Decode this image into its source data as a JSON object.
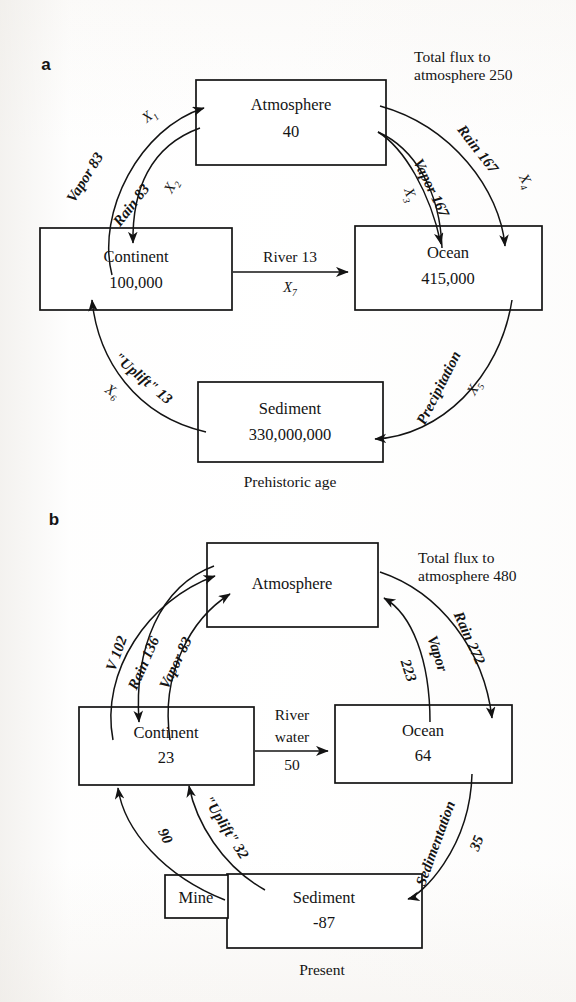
{
  "figure": {
    "title_present": false,
    "panels": [
      {
        "id": "a",
        "letter": "a",
        "caption": "Prehistoric age",
        "flux_header_line1": "Total flux to",
        "flux_header_line2": "atmosphere 250",
        "nodes": [
          {
            "name": "atmosphere",
            "label": "Atmosphere",
            "value": "40"
          },
          {
            "name": "continent",
            "label": "Continent",
            "value": "100,000"
          },
          {
            "name": "ocean",
            "label": "Ocean",
            "value": "415,000"
          },
          {
            "name": "sediment",
            "label": "Sediment",
            "value": "330,000,000"
          }
        ],
        "flows": [
          {
            "name": "continent-to-atmosphere-vapor",
            "label": "Vapor 83",
            "symbol": "X",
            "sub": "1"
          },
          {
            "name": "atmosphere-to-continent-rain",
            "label": "Rain 83",
            "symbol": "X",
            "sub": "2"
          },
          {
            "name": "ocean-to-atmosphere-vapor",
            "label": "Vapor 167",
            "symbol": "X",
            "sub": "3"
          },
          {
            "name": "atmosphere-to-ocean-rain",
            "label": "Rain 167",
            "symbol": "X",
            "sub": "4"
          },
          {
            "name": "ocean-to-sediment-precipitation",
            "label": "Precipitation",
            "symbol": "X",
            "sub": "5"
          },
          {
            "name": "sediment-to-continent-uplift",
            "label": "\"Uplift\" 13",
            "symbol": "X",
            "sub": "6"
          },
          {
            "name": "continent-to-ocean-river",
            "label": "River 13",
            "symbol": "X",
            "sub": "7"
          }
        ]
      },
      {
        "id": "b",
        "letter": "b",
        "caption": "Present",
        "flux_header_line1": "Total flux to",
        "flux_header_line2": "atmosphere 480",
        "nodes": [
          {
            "name": "atmosphere",
            "label": "Atmosphere",
            "value": ""
          },
          {
            "name": "continent",
            "label": "Continent",
            "value": "23"
          },
          {
            "name": "ocean",
            "label": "Ocean",
            "value": "64"
          },
          {
            "name": "sediment",
            "label": "Sediment",
            "value": "-87"
          },
          {
            "name": "mine",
            "label": "Mine",
            "value": ""
          }
        ],
        "flows": [
          {
            "name": "continent-to-atmosphere-v",
            "label": "V 102",
            "symbol": "",
            "sub": ""
          },
          {
            "name": "atmosphere-to-continent-rain",
            "label": "Rain 136",
            "symbol": "",
            "sub": ""
          },
          {
            "name": "continent-to-atmosphere-vapor",
            "label": "Vapor 83",
            "symbol": "",
            "sub": ""
          },
          {
            "name": "ocean-to-atmosphere-vapor",
            "label": "Vapor",
            "value": "223",
            "symbol": "",
            "sub": ""
          },
          {
            "name": "atmosphere-to-ocean-rain",
            "label": "Rain 272",
            "symbol": "",
            "sub": ""
          },
          {
            "name": "ocean-to-sediment-sedimentation",
            "label": "Sedimentation",
            "value": "35",
            "symbol": "",
            "sub": ""
          },
          {
            "name": "sediment-to-continent-uplift",
            "label": "\"Uplift\" 32",
            "symbol": "",
            "sub": ""
          },
          {
            "name": "mine-to-continent",
            "label": "90",
            "symbol": "",
            "sub": ""
          },
          {
            "name": "continent-to-ocean-river",
            "label_line1": "River",
            "label_line2": "water",
            "value": "50",
            "symbol": "",
            "sub": ""
          }
        ]
      }
    ]
  },
  "colors": {
    "ink": "#131313",
    "paper": "#ffffff"
  }
}
